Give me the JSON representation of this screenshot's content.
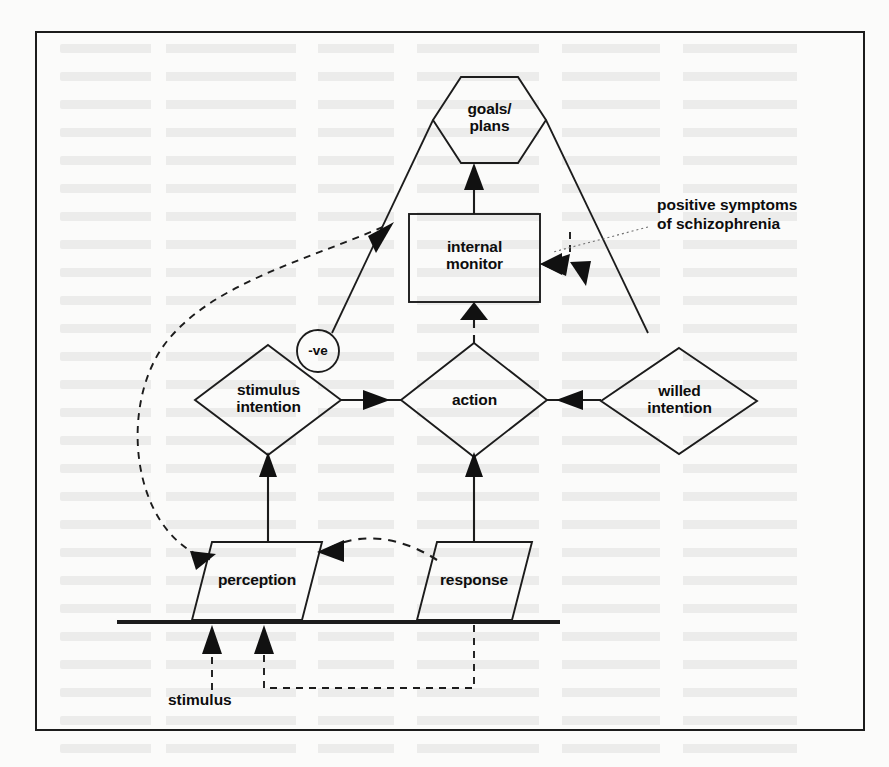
{
  "figure": {
    "kind": "flow-diagram",
    "border_color": "#1c1c1c",
    "line_color": "#1c1c1c",
    "background": "#fbfbfa"
  },
  "nodes": {
    "goals_plans": {
      "label": "goals/\nplans",
      "shape": "hexagon"
    },
    "internal_monitor": {
      "label": "internal\nmonitor",
      "shape": "rectangle"
    },
    "stimulus_intention": {
      "label": "stimulus\nintention",
      "shape": "diamond"
    },
    "action": {
      "label": "action",
      "shape": "diamond"
    },
    "willed_intention": {
      "label": "willed\nintention",
      "shape": "diamond"
    },
    "perception": {
      "label": "perception",
      "shape": "parallelogram"
    },
    "response": {
      "label": "response",
      "shape": "parallelogram"
    }
  },
  "badges": {
    "negative": {
      "label": "-ve",
      "shape": "circle"
    }
  },
  "annotations": {
    "positive_symptoms": {
      "label": "positive symptoms\nof schizophrenia"
    },
    "stimulus": {
      "label": "stimulus"
    }
  }
}
